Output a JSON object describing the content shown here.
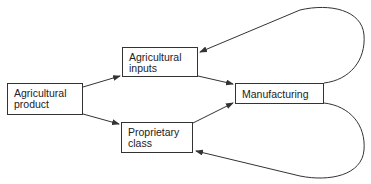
{
  "diagram": {
    "nodes": [
      {
        "id": "agricultural-product",
        "line1": "Agricultural",
        "line2": "product"
      },
      {
        "id": "agricultural-inputs",
        "line1": "Agricultural",
        "line2": "inputs"
      },
      {
        "id": "proprietary-class",
        "line1": "Proprietary",
        "line2": "class"
      },
      {
        "id": "manufacturing",
        "line1": "Manufacturing"
      }
    ],
    "edges": [
      {
        "from": "agricultural-product",
        "to": "agricultural-inputs"
      },
      {
        "from": "agricultural-product",
        "to": "proprietary-class"
      },
      {
        "from": "agricultural-inputs",
        "to": "manufacturing"
      },
      {
        "from": "proprietary-class",
        "to": "manufacturing"
      },
      {
        "from": "manufacturing",
        "to": "agricultural-inputs",
        "style": "loop"
      },
      {
        "from": "manufacturing",
        "to": "proprietary-class",
        "style": "loop"
      }
    ],
    "line_color": "#333333"
  }
}
